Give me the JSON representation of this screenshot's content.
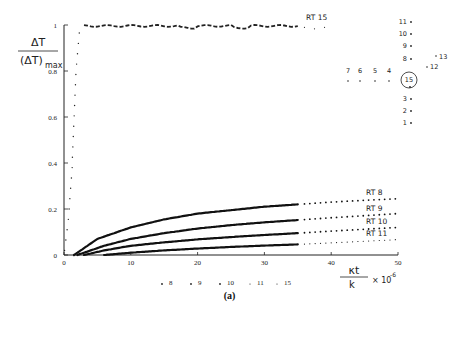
{
  "header_text": "…",
  "caption": "(a)",
  "chart_data": {
    "type": "line",
    "title": "",
    "ylabel": "ΔT / (ΔT)max",
    "xlabel": "κt / k × 10^-6",
    "xlim": [
      0,
      50
    ],
    "ylim": [
      0,
      1
    ],
    "x_ticks": [
      0,
      10,
      20,
      30,
      40,
      50
    ],
    "y_ticks": [
      0,
      0.2,
      0.4,
      0.6,
      0.8,
      1
    ],
    "grid": false,
    "series": [
      {
        "name": "RT 15",
        "style": "dotted",
        "x": [
          0,
          0.5,
          1,
          1.5,
          2,
          3,
          5,
          10,
          20,
          30,
          35
        ],
        "values": [
          0,
          0.15,
          0.45,
          0.8,
          0.97,
          1.0,
          1.0,
          1.0,
          0.99,
          0.99,
          1.0
        ]
      },
      {
        "name": "RT 8",
        "style": "solid-then-dotted",
        "x": [
          1.5,
          3,
          5,
          10,
          15,
          20,
          25,
          30,
          35,
          40,
          45,
          50
        ],
        "values": [
          0,
          0.03,
          0.07,
          0.12,
          0.155,
          0.18,
          0.195,
          0.21,
          0.22,
          0.23,
          0.238,
          0.245
        ]
      },
      {
        "name": "RT 9",
        "style": "solid-then-dotted",
        "x": [
          2,
          4,
          6,
          10,
          15,
          20,
          25,
          30,
          35,
          40,
          45,
          50
        ],
        "values": [
          0,
          0.02,
          0.04,
          0.07,
          0.095,
          0.115,
          0.13,
          0.142,
          0.152,
          0.162,
          0.171,
          0.18
        ]
      },
      {
        "name": "RT 10",
        "style": "solid-then-dotted",
        "x": [
          3,
          6,
          10,
          15,
          20,
          25,
          30,
          35,
          40,
          45,
          50
        ],
        "values": [
          0,
          0.02,
          0.04,
          0.055,
          0.068,
          0.078,
          0.087,
          0.095,
          0.104,
          0.112,
          0.12
        ]
      },
      {
        "name": "RT 11",
        "style": "solid-then-dotted",
        "x": [
          6,
          10,
          15,
          20,
          25,
          30,
          35,
          40,
          45,
          50
        ],
        "values": [
          0,
          0.01,
          0.02,
          0.028,
          0.035,
          0.041,
          0.046,
          0.053,
          0.06,
          0.067
        ]
      }
    ],
    "annotations": [
      "RT 15",
      "RT 8",
      "RT 9",
      "RT 10",
      "RT 11"
    ],
    "bottom_legend": [
      "8",
      "9",
      "10",
      "11",
      "15"
    ],
    "inset_layout": {
      "vertical_column": [
        "11",
        "10",
        "9",
        "8",
        "15",
        "3",
        "2",
        "1"
      ],
      "horizontal_row": [
        "7",
        "6",
        "5",
        "4"
      ],
      "diagonal": [
        "12",
        "13"
      ],
      "circled": "15"
    }
  }
}
